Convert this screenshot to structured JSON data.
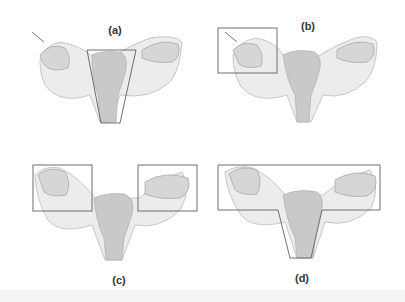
{
  "figure": {
    "colors": {
      "background": "#ffffff",
      "organ": "#c9c9c9",
      "organ_shade": "#b3b3b3",
      "ligament": "#ececec",
      "box_stroke": "#6e6e6e"
    },
    "panels": [
      {
        "id": "a",
        "label": "(a)",
        "highlight": "uterus-trapezoid"
      },
      {
        "id": "b",
        "label": "(b)",
        "highlight": "right-adnexa-box"
      },
      {
        "id": "c",
        "label": "(c)",
        "highlight": "bilateral-adnexa-boxes"
      },
      {
        "id": "d",
        "label": "(d)",
        "highlight": "uterus-and-bilateral-adnexa"
      }
    ]
  }
}
